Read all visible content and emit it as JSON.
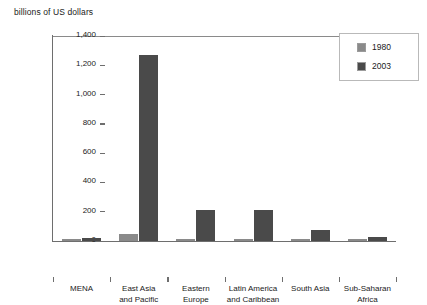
{
  "chart_data": {
    "type": "bar",
    "title": "",
    "subtitle": "",
    "axis_title": "billions of US dollars",
    "xlabel": "",
    "ylabel": "billions of US dollars",
    "ylim": [
      0,
      1400
    ],
    "yticks": [
      0,
      200,
      400,
      600,
      800,
      1000,
      1200,
      1400
    ],
    "ytick_labels": [
      "0",
      "200",
      "400",
      "600",
      "800",
      "1,000",
      "1,200",
      "1,400"
    ],
    "grid": false,
    "legend_position": "top-right",
    "categories": [
      "MENA",
      "East Asia and Pacific",
      "Eastern Europe",
      "Latin America and Caribbean",
      "South Asia",
      "Sub-Saharan Africa"
    ],
    "category_lines": [
      [
        "MENA"
      ],
      [
        "East Asia",
        "and Pacific"
      ],
      [
        "Eastern",
        "Europe"
      ],
      [
        "Latin America",
        "and Caribbean"
      ],
      [
        "South Asia"
      ],
      [
        "Sub-Saharan",
        "Africa"
      ]
    ],
    "series": [
      {
        "name": "1980",
        "color": "#8a8a8a",
        "values": [
          5,
          50,
          15,
          10,
          5,
          5
        ]
      },
      {
        "name": "2003",
        "color": "#4a4a4a",
        "values": [
          20,
          1270,
          210,
          210,
          75,
          30
        ]
      }
    ]
  },
  "legend": {
    "items": [
      {
        "label": "1980",
        "color": "#8a8a8a"
      },
      {
        "label": "2003",
        "color": "#4a4a4a"
      }
    ]
  },
  "colors": {
    "series_1980": "#8a8a8a",
    "series_2003": "#4a4a4a",
    "axis": "#6e6e6e",
    "text": "#1a1a1a",
    "background": "#ffffff"
  }
}
